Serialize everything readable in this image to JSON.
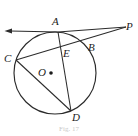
{
  "figure": {
    "caption": "Fig. 17",
    "stroke_color": "#2b2b2b",
    "label_color": "#1c1c1c",
    "background_color": "#ffffff",
    "labels": {
      "A": "A",
      "B": "B",
      "C": "C",
      "D": "D",
      "E": "E",
      "O": "O",
      "P": "P"
    },
    "points": {
      "A": {
        "x": 58,
        "y": 32
      },
      "B": {
        "x": 87,
        "y": 43
      },
      "C": {
        "x": 16,
        "y": 60
      },
      "D": {
        "x": 71,
        "y": 111
      },
      "E": {
        "x": 62,
        "y": 53
      },
      "O": {
        "x": 51,
        "y": 73
      },
      "P": {
        "x": 125,
        "y": 27
      }
    },
    "circle": {
      "cx": 55,
      "cy": 73,
      "r": 41
    },
    "segments": [
      {
        "name": "tangent-ray-left",
        "from": "A",
        "to": "arrow-left-end",
        "arrow": "start"
      },
      {
        "name": "tangent-A-to-P",
        "from": "A",
        "to": "P",
        "arrow": "none"
      },
      {
        "name": "secant-P-through-B-to-C",
        "from": "P",
        "to": "C",
        "arrow": "none"
      },
      {
        "name": "chord-A-D",
        "from": "A",
        "to": "D",
        "arrow": "none"
      },
      {
        "name": "chord-C-D",
        "from": "C",
        "to": "D",
        "arrow": "none"
      }
    ],
    "center_dot": {
      "x": 51,
      "y": 73,
      "r": 1.7
    }
  }
}
